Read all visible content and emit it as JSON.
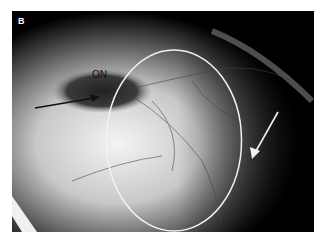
{
  "figure": {
    "panel_label": "B",
    "annotations": {
      "optic_nerve_label": "ON",
      "black_arrow": "pointing to optic nerve",
      "white_arrow": "pointing to region at right edge of ellipse",
      "ellipse": "white outline circling vascular region"
    },
    "colors": {
      "background": "#ffffff",
      "image_dark": "#000000",
      "annotation_white": "#f2f2f2",
      "annotation_black": "#111111"
    }
  }
}
